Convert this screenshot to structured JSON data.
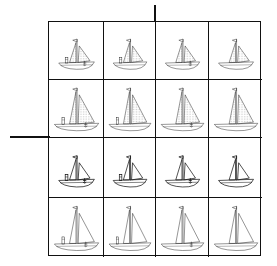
{
  "figure": {
    "axes": {
      "vertical_divider_x": 155,
      "horizontal_divider_y": 137
    },
    "colors": {
      "line": "#111111",
      "stipple": "#555555",
      "background": "#ffffff"
    },
    "rows": [
      {
        "sail": "stippled",
        "size": "small"
      },
      {
        "sail": "stippled",
        "size": "large"
      },
      {
        "sail": "plain",
        "size": "small"
      },
      {
        "sail": "plain",
        "size": "large"
      }
    ],
    "columns": [
      {
        "chimney": true,
        "anchor": true
      },
      {
        "chimney": true,
        "anchor": false
      },
      {
        "chimney": false,
        "anchor": true
      },
      {
        "chimney": false,
        "anchor": false
      }
    ]
  }
}
